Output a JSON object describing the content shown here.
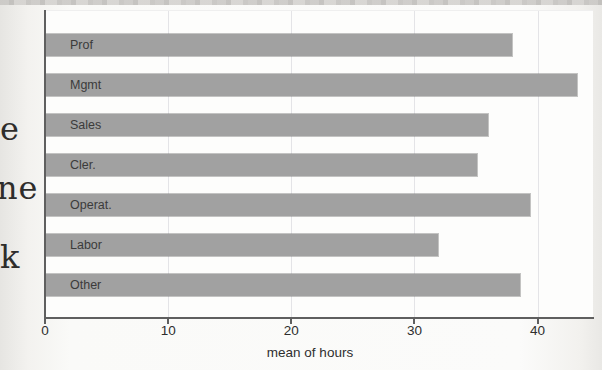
{
  "scan": {
    "cutoff_text_fragments": [
      "e",
      "ne",
      "k"
    ]
  },
  "chart_data": {
    "type": "bar",
    "orientation": "horizontal",
    "title": "",
    "xlabel": "mean of hours",
    "ylabel": "",
    "categories": [
      "Prof",
      "Mgmt",
      "Sales",
      "Cler.",
      "Operat.",
      "Labor",
      "Other"
    ],
    "values": [
      37.9,
      43.2,
      36.0,
      35.1,
      39.4,
      31.9,
      38.6
    ],
    "xticks": [
      0,
      10,
      20,
      30,
      40
    ],
    "xlim": [
      0,
      44.5
    ],
    "grid": true,
    "legend": false,
    "bar_color": "#a1a1a1",
    "axis_color": "#5f5f5f",
    "gridline_color": "#e4e4e7",
    "bar_label_color": "#3b3b3b",
    "tick_label_color": "#2e2e2e"
  }
}
